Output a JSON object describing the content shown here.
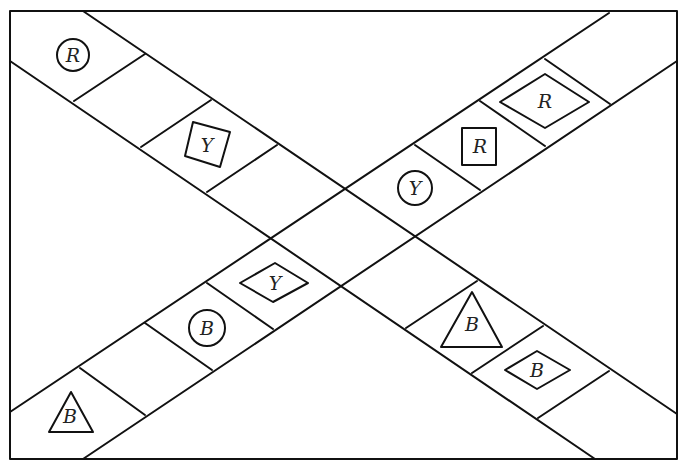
{
  "diagram": {
    "frame": {
      "x": 10,
      "y": 11,
      "width": 667,
      "height": 448
    },
    "line_color": "#111111",
    "bands": [
      {
        "id": "band-descending",
        "edges": [
          [
            [
              83,
              11
            ],
            [
              677,
              414
            ]
          ],
          [
            [
              10,
              61
            ],
            [
              595,
              459
            ]
          ]
        ],
        "rungs": [
          [
            [
              145,
              54
            ],
            [
              74,
              101
            ]
          ],
          [
            [
              211,
              100
            ],
            [
              141,
              147
            ]
          ],
          [
            [
              277,
              145
            ],
            [
              207,
              192
            ]
          ],
          [
            [
              477,
              281
            ],
            [
              406,
              328
            ]
          ],
          [
            [
              543,
              326
            ],
            [
              472,
              373
            ]
          ],
          [
            [
              609,
              371
            ],
            [
              538,
              418
            ]
          ]
        ]
      },
      {
        "id": "band-ascending",
        "edges": [
          [
            [
              10,
              412
            ],
            [
              609,
              13
            ]
          ],
          [
            [
              83,
              459
            ],
            [
              677,
              61
            ]
          ]
        ],
        "rungs": [
          [
            [
              80,
              368
            ],
            [
              145,
              415
            ]
          ],
          [
            [
              145,
              323
            ],
            [
              212,
              370
            ]
          ],
          [
            [
              207,
              283
            ],
            [
              273,
              329
            ]
          ],
          [
            [
              415,
              145
            ],
            [
              480,
              190
            ]
          ],
          [
            [
              480,
              101
            ],
            [
              545,
              146
            ]
          ],
          [
            [
              545,
              59
            ],
            [
              610,
              104
            ]
          ]
        ]
      }
    ],
    "tokens": [
      {
        "shape": "circle",
        "label": "R",
        "cx": 73,
        "cy": 55,
        "r": 16
      },
      {
        "shape": "tilted-square",
        "label": "Y",
        "points": "193,122 230,132 220,167 185,156",
        "tx": 207,
        "ty": 145
      },
      {
        "shape": "circle",
        "label": "Y",
        "cx": 415,
        "cy": 188,
        "r": 17
      },
      {
        "shape": "square",
        "label": "R",
        "x": 462,
        "y": 128,
        "w": 34,
        "h": 37,
        "tx": 480,
        "ty": 146
      },
      {
        "shape": "diamond",
        "label": "R",
        "points": "500,102 545,74 589,102 545,128",
        "tx": 545,
        "ty": 101
      },
      {
        "shape": "diamond",
        "label": "Y",
        "points": "240,283 275,263 308,283 273,302",
        "tx": 275,
        "ty": 283
      },
      {
        "shape": "circle",
        "label": "B",
        "cx": 207,
        "cy": 328,
        "r": 18
      },
      {
        "shape": "triangle",
        "label": "B",
        "points": "71,392 93,432 49,432",
        "tx": 70,
        "ty": 416
      },
      {
        "shape": "triangle",
        "label": "B",
        "points": "472,292 502,347 441,347",
        "tx": 472,
        "ty": 324
      },
      {
        "shape": "diamond",
        "label": "B",
        "points": "505,370 537,351 570,370 537,389",
        "tx": 537,
        "ty": 370
      }
    ]
  }
}
